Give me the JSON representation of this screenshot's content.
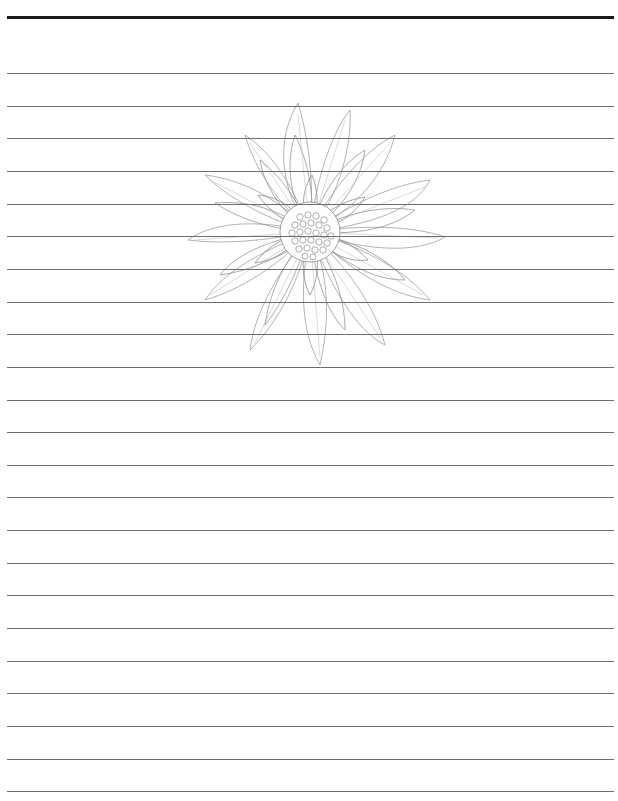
{
  "page": {
    "type": "lined stationery paper",
    "background_color": "#ffffff",
    "top_rule": {
      "y": 16,
      "thickness": 3,
      "color": "#1a1a1a"
    },
    "rules": {
      "count": 23,
      "first_y": 73,
      "spacing": 32.65,
      "left": 7,
      "right": 614,
      "color": "#6e6e6e"
    },
    "illustration": {
      "subject": "flower-drawing",
      "description": "Pencil line drawing of a chrysanthemum/daisy-like flower",
      "center": [
        310,
        232
      ],
      "line_color": "#9a9a9a"
    }
  }
}
